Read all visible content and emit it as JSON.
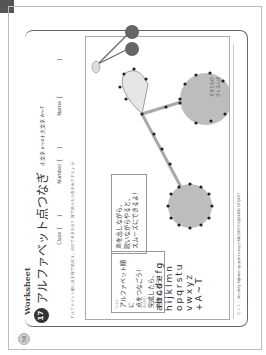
{
  "page": {
    "page_number": "58",
    "section_label": "Worksheet",
    "worksheet_number": "17",
    "title": "アルファベット点つなぎ",
    "subtitle": "小文字 a～z＋大文字 A～T",
    "fields": {
      "class_label": "Class［　　］",
      "number_label": "Number［　　］",
      "name_label": "Name［　　　　　　　］"
    },
    "instruction": "アルファベット順に点を線で結ぼう。何ができるかな？ 線で結べたら色をぬりましょう！"
  },
  "boxes": {
    "box1": {
      "ruby": "じゅん",
      "line1": "アルファベット順に",
      "line2": "点をつなごう！",
      "ruby2": "かんせい",
      "line3": "完成したら、",
      "line4": "色をぬろう！"
    },
    "box2": {
      "line1": "声を出しながら、",
      "line2": "歌いながらやると、",
      "line3": "スムーズにできるよ！"
    }
  },
  "alphabet_rows": [
    "abcdefg",
    "hijklmn",
    "opqrstu",
    "vwxyz",
    "+A~T"
  ],
  "reference": {
    "label_line1": "できたもの",
    "label_line2": "さくらんぼ"
  },
  "hint": "ヒント：abcdefg hijklmn opqrstu vwxyz ABCDEFG HIJKLMN OPQRST",
  "colors": {
    "cherry_fill": "#bdbdbd",
    "leaf_fill": "#e6e6e6",
    "stem": "#a8a8a8",
    "dot": "#222222",
    "ref_cherry": "#666666"
  }
}
